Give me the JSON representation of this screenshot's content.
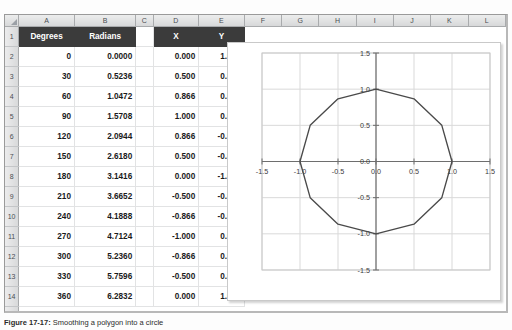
{
  "app": {
    "type": "spreadsheet",
    "select_all_icon": "select-all-triangle-icon"
  },
  "sheet": {
    "column_letters": [
      "A",
      "B",
      "C",
      "D",
      "E",
      "F",
      "G",
      "H",
      "I",
      "J",
      "K",
      "L"
    ],
    "row_numbers": [
      1,
      2,
      3,
      4,
      5,
      6,
      7,
      8,
      9,
      10,
      11,
      12,
      13,
      14,
      15,
      16,
      17,
      18,
      19,
      20,
      21,
      22,
      23
    ],
    "headers": {
      "a": "Degrees",
      "b": "Radians",
      "c": "",
      "d": "X",
      "e": "Y"
    },
    "header_bg": "#3b3b3b",
    "header_fg": "#ffffff",
    "rows": [
      {
        "row": 2,
        "degrees": "0",
        "radians": "0.0000",
        "x": "0.000",
        "y": "1.000"
      },
      {
        "row": 3,
        "degrees": "30",
        "radians": "0.5236",
        "x": "0.500",
        "y": "0.866"
      },
      {
        "row": 4,
        "degrees": "60",
        "radians": "1.0472",
        "x": "0.866",
        "y": "0.500"
      },
      {
        "row": 5,
        "degrees": "90",
        "radians": "1.5708",
        "x": "1.000",
        "y": "0.000"
      },
      {
        "row": 6,
        "degrees": "120",
        "radians": "2.0944",
        "x": "0.866",
        "y": "-0.500"
      },
      {
        "row": 7,
        "degrees": "150",
        "radians": "2.6180",
        "x": "0.500",
        "y": "-0.866"
      },
      {
        "row": 8,
        "degrees": "180",
        "radians": "3.1416",
        "x": "0.000",
        "y": "-1.000"
      },
      {
        "row": 9,
        "degrees": "210",
        "radians": "3.6652",
        "x": "-0.500",
        "y": "-0.866"
      },
      {
        "row": 10,
        "degrees": "240",
        "radians": "4.1888",
        "x": "-0.866",
        "y": "-0.500"
      },
      {
        "row": 11,
        "degrees": "270",
        "radians": "4.7124",
        "x": "-1.000",
        "y": "0.000"
      },
      {
        "row": 12,
        "degrees": "300",
        "radians": "5.2360",
        "x": "-0.866",
        "y": "0.500"
      },
      {
        "row": 13,
        "degrees": "330",
        "radians": "5.7596",
        "x": "-0.500",
        "y": "0.866"
      },
      {
        "row": 14,
        "degrees": "360",
        "radians": "6.2832",
        "x": "0.000",
        "y": "1.000"
      }
    ]
  },
  "chart_data": {
    "type": "scatter",
    "title": "",
    "xlabel": "",
    "ylabel": "",
    "xlim": [
      -1.5,
      1.5
    ],
    "ylim": [
      -1.5,
      1.5
    ],
    "xticks": [
      "-1.5",
      "-1.0",
      "-0.5",
      "0.0",
      "0.5",
      "1.0",
      "1.5"
    ],
    "yticks": [
      "1.5",
      "1.0",
      "0.5",
      "0.0",
      "-0.5",
      "-1.0",
      "-1.5"
    ],
    "xtick_values": [
      -1.5,
      -1.0,
      -0.5,
      0.0,
      0.5,
      1.0,
      1.5
    ],
    "ytick_values": [
      1.5,
      1.0,
      0.5,
      0.0,
      -0.5,
      -1.0,
      -1.5
    ],
    "grid": true,
    "legend": "none",
    "line_color": "#4a4a4a",
    "grid_color": "#d9d9d9",
    "axis_color": "#808080",
    "series": [
      {
        "name": "Unit circle polygon",
        "closed": true,
        "points": [
          [
            0.0,
            1.0
          ],
          [
            0.5,
            0.866
          ],
          [
            0.866,
            0.5
          ],
          [
            1.0,
            0.0
          ],
          [
            0.866,
            -0.5
          ],
          [
            0.5,
            -0.866
          ],
          [
            0.0,
            -1.0
          ],
          [
            -0.5,
            -0.866
          ],
          [
            -0.866,
            -0.5
          ],
          [
            -1.0,
            0.0
          ],
          [
            -0.866,
            0.5
          ],
          [
            -0.5,
            0.866
          ],
          [
            0.0,
            1.0
          ]
        ]
      }
    ]
  },
  "caption": {
    "figure_label": "Figure 17-17:",
    "text": " Smoothing a polygon into a circle"
  }
}
